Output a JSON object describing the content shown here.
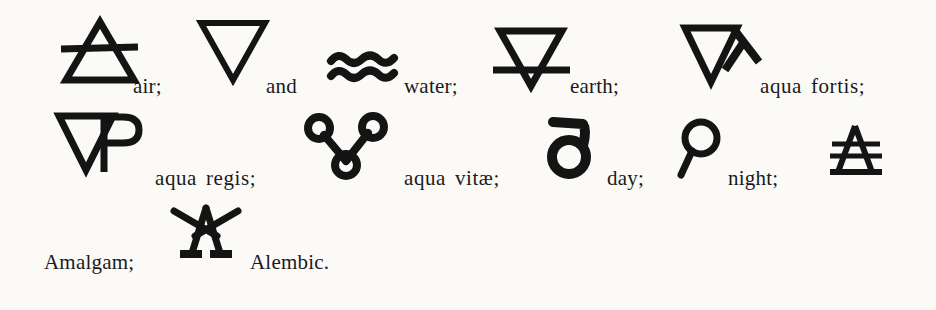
{
  "page": {
    "background_color": "#fbfaf7",
    "ink_color": "#141414"
  },
  "entries": [
    {
      "id": "air",
      "symbol_name": "air-symbol",
      "caption": "air;",
      "glyph": {
        "x": 58,
        "y": 16,
        "w": 84,
        "h": 70
      },
      "label": {
        "x": 133,
        "y": 76
      }
    },
    {
      "id": "and",
      "symbol_name": "inverted-triangle-symbol",
      "caption": "and",
      "glyph": {
        "x": 196,
        "y": 18,
        "w": 74,
        "h": 66
      },
      "label": {
        "x": 266,
        "y": 76
      }
    },
    {
      "id": "water",
      "symbol_name": "water-symbol",
      "caption": "water;",
      "glyph": {
        "x": 327,
        "y": 52,
        "w": 78,
        "h": 32
      },
      "label": {
        "x": 404,
        "y": 76
      }
    },
    {
      "id": "earth",
      "symbol_name": "earth-symbol",
      "caption": "earth;",
      "glyph": {
        "x": 490,
        "y": 26,
        "w": 84,
        "h": 64
      },
      "label": {
        "x": 570,
        "y": 76
      }
    },
    {
      "id": "aqua-fortis",
      "symbol_name": "aqua-fortis-symbol",
      "caption": "aqua fortis;",
      "glyph": {
        "x": 681,
        "y": 22,
        "w": 86,
        "h": 66
      },
      "label": {
        "x": 760,
        "y": 76
      }
    },
    {
      "id": "aqua-regis",
      "symbol_name": "aqua-regis-symbol",
      "caption": "aqua regis;",
      "glyph": {
        "x": 55,
        "y": 110,
        "w": 90,
        "h": 68
      },
      "label": {
        "x": 155,
        "y": 168
      }
    },
    {
      "id": "aqua-vitae",
      "symbol_name": "aqua-vitae-symbol",
      "caption": "aqua vitæ;",
      "glyph": {
        "x": 304,
        "y": 113,
        "w": 84,
        "h": 66
      },
      "label": {
        "x": 404,
        "y": 168
      }
    },
    {
      "id": "day",
      "symbol_name": "day-symbol",
      "caption": "day;",
      "glyph": {
        "x": 545,
        "y": 116,
        "w": 50,
        "h": 62
      },
      "label": {
        "x": 607,
        "y": 168
      }
    },
    {
      "id": "night",
      "symbol_name": "night-symbol",
      "caption": "night;",
      "glyph": {
        "x": 676,
        "y": 118,
        "w": 46,
        "h": 60
      },
      "label": {
        "x": 728,
        "y": 168
      }
    },
    {
      "id": "amalgam",
      "symbol_name": "amalgam-symbol",
      "caption": "Amalgam;",
      "glyph": {
        "x": 828,
        "y": 122,
        "w": 56,
        "h": 56
      },
      "label": {
        "x": 44,
        "y": 252
      }
    },
    {
      "id": "alembic",
      "symbol_name": "alembic-symbol",
      "caption": "Alembic.",
      "glyph": {
        "x": 170,
        "y": 203,
        "w": 72,
        "h": 56
      },
      "label": {
        "x": 250,
        "y": 252
      }
    }
  ]
}
